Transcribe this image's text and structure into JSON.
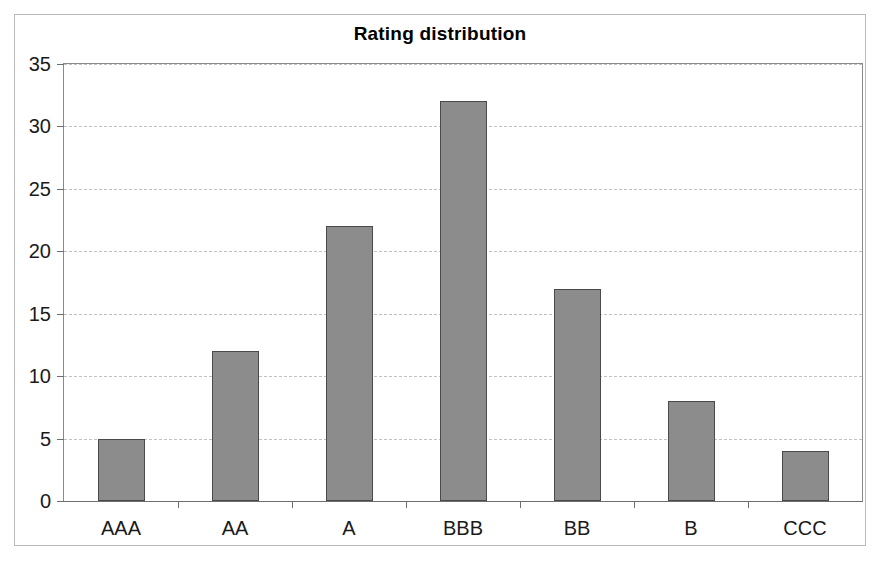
{
  "chart_data": {
    "type": "bar",
    "title": "Rating distribution",
    "categories": [
      "AAA",
      "AA",
      "A",
      "BBB",
      "BB",
      "B",
      "CCC"
    ],
    "values": [
      5,
      12,
      22,
      32,
      17,
      8,
      4
    ],
    "xlabel": "",
    "ylabel": "",
    "ylim": [
      0,
      35
    ],
    "ytick_labels": [
      "0",
      "5",
      "10",
      "15",
      "20",
      "25",
      "30",
      "35"
    ],
    "ytick_values": [
      0,
      5,
      10,
      15,
      20,
      25,
      30,
      35
    ],
    "grid": true,
    "legend": false,
    "bar_color": "#8c8c8c",
    "bar_border_color": "#4a4a4a",
    "gridline_color": "#c2c2c2",
    "axis_color": "#6e6e6e",
    "frame_color": "#b9b9b9",
    "background": "#ffffff"
  }
}
